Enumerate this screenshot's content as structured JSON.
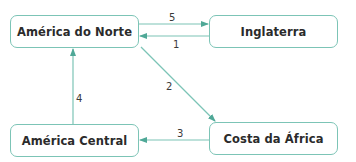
{
  "colors": {
    "stroke": "#7cc4b6",
    "arrowhead": "#4fa897",
    "text": "#2b2b2b"
  },
  "nodes": [
    {
      "id": "america-do-norte",
      "label": "América do Norte"
    },
    {
      "id": "inglaterra",
      "label": "Inglaterra"
    },
    {
      "id": "america-central",
      "label": "América Central"
    },
    {
      "id": "costa-da-africa",
      "label": "Costa da África"
    }
  ],
  "edges": [
    {
      "from": "america-do-norte",
      "to": "inglaterra",
      "label": "5"
    },
    {
      "from": "inglaterra",
      "to": "america-do-norte",
      "label": "1"
    },
    {
      "from": "america-do-norte",
      "to": "costa-da-africa",
      "label": "2"
    },
    {
      "from": "costa-da-africa",
      "to": "america-central",
      "label": "3"
    },
    {
      "from": "america-central",
      "to": "america-do-norte",
      "label": "4"
    }
  ]
}
